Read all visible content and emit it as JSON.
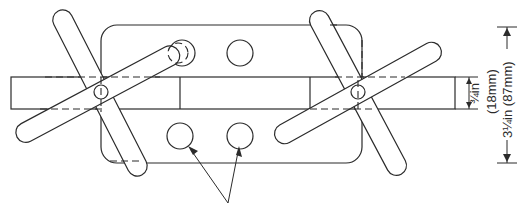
{
  "diagram": {
    "type": "mechanical line drawing",
    "colors": {
      "line": "#2b2b2b",
      "background": "#ffffff"
    },
    "dimensions": {
      "bar_thickness": {
        "imperial": "¾in",
        "metric": "(18mm)"
      },
      "plate_height": {
        "imperial": "3¼in",
        "metric": "(87mm)"
      }
    },
    "labels": {
      "bar_thickness_text": "¾in",
      "bar_thickness_metric_text": "(18mm)",
      "plate_height_text": "3¼in  (87mm)"
    },
    "components": [
      {
        "name": "base-plate",
        "shape": "rounded rectangle"
      },
      {
        "name": "bar",
        "shape": "long rectangle"
      },
      {
        "name": "left-cross-piece",
        "shape": "X of two rounded arms",
        "pivot": "small circle"
      },
      {
        "name": "right-cross-piece",
        "shape": "X of two rounded arms",
        "pivot": "small circle"
      },
      {
        "name": "holes",
        "count": 4
      },
      {
        "name": "pointer-arrows",
        "count": 2,
        "target": "lower holes"
      }
    ]
  }
}
